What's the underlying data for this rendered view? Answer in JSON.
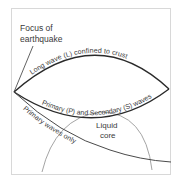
{
  "diagram": {
    "labels": {
      "focus_line1": "Focus of",
      "focus_line2": "earthquake",
      "long_wave": "Long wave (L) confined to crust",
      "primary_secondary": "Primary (P) and Secondary (S) waves",
      "primary_only": "Primary waves only",
      "core_line1": "Liquid",
      "core_line2": "core"
    },
    "colors": {
      "frame": "#d8d8d8",
      "wave_line": "#2a2a2a",
      "core_line": "#9a9a9a",
      "text": "#3a3a3a"
    }
  }
}
